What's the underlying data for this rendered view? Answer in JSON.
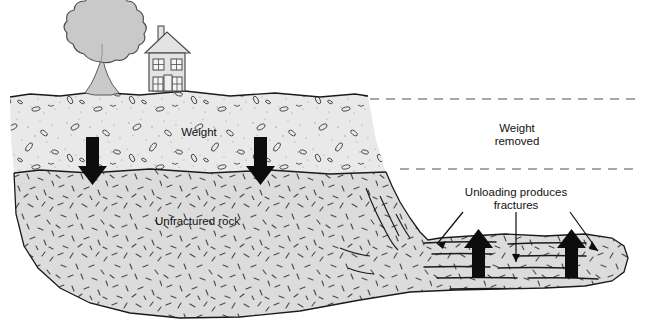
{
  "diagram": {
    "canvas": {
      "width": 645,
      "height": 322,
      "background": "#ffffff"
    },
    "labels": {
      "weight": "Weight",
      "unfractured_rock": "Unfractured rock",
      "weight_removed_line1": "Weight",
      "weight_removed_line2": "removed",
      "unloading_line1": "Unloading produces",
      "unloading_line2": "fractures"
    },
    "surface_objects": [
      {
        "name": "tree",
        "label": "tree"
      },
      {
        "name": "house",
        "label": "house"
      }
    ],
    "layers": [
      {
        "name": "sediment",
        "label": "Weight",
        "fill": "#e9e9e9",
        "stroke": "#1a1a1a",
        "texture": "stipple-and-pebbles"
      },
      {
        "name": "bedrock",
        "label": "Unfractured rock",
        "fill": "#dcdcdc",
        "stroke": "#1a1a1a",
        "texture": "random-dashes"
      }
    ],
    "arrows": {
      "down": [
        {
          "name": "weight-arrow-left",
          "x": 92,
          "direction": "down"
        },
        {
          "name": "weight-arrow-right",
          "x": 260,
          "direction": "down"
        }
      ],
      "up": [
        {
          "name": "unloading-arrow-left",
          "x": 478,
          "direction": "up"
        },
        {
          "name": "unloading-arrow-right",
          "x": 571,
          "direction": "up"
        }
      ]
    },
    "guides": [
      {
        "name": "former-ground-surface",
        "style": "dashed",
        "y": 99,
        "x1": 370,
        "x2": 640
      },
      {
        "name": "former-rock-surface",
        "style": "dashed",
        "y": 169,
        "x1": 400,
        "x2": 640
      }
    ],
    "colors": {
      "ink": "#1a1a1a",
      "sediment_fill": "#e9e9e9",
      "bedrock_fill": "#dcdcdc",
      "tree_fill": "#c9c9c9",
      "house_fill": "#e3e3e3",
      "dash_guide": "#8a8a8a"
    }
  }
}
